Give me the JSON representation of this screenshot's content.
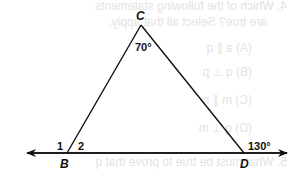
{
  "diagram": {
    "type": "triangle-with-extended-base-line",
    "vertices": {
      "C": {
        "label": "C",
        "x": 141,
        "y": 25
      },
      "B": {
        "label": "B",
        "x": 67,
        "y": 153
      },
      "D": {
        "label": "D",
        "x": 244,
        "y": 153
      }
    },
    "base_line": {
      "x1": 27,
      "x2": 287,
      "y": 153,
      "arrows": "both"
    },
    "angles": {
      "C": "70°",
      "angle_1": "1",
      "angle_2": "2",
      "exterior_D": "130°"
    },
    "colors": {
      "line": "#111111",
      "text": "#111111",
      "bleed_through": "#e3e3e3"
    }
  },
  "bleed_through_text": {
    "question_line1": "4. Which of the following statements",
    "question_line2": "are true? Select all that apply.",
    "options": [
      "(A) a ∥ q",
      "(B) q ⊥ p",
      "(C) m ∥ n",
      "(D) q ⊥ m"
    ],
    "question5": "5. What must be true to prove that q"
  }
}
